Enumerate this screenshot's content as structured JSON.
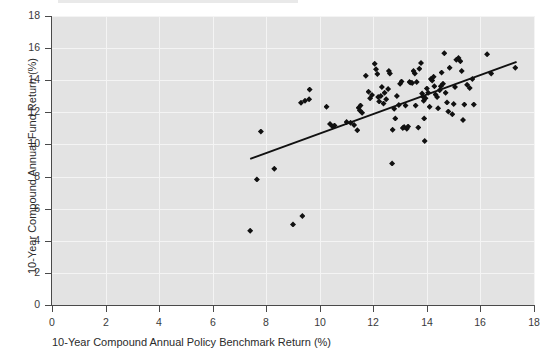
{
  "chart_data": {
    "type": "scatter",
    "title": "",
    "xlabel": "10-Year Compound Annual Policy Benchmark Return (%)",
    "ylabel": "10-Year Compound Annual Fund Return (%)",
    "xlim": [
      0,
      18
    ],
    "ylim": [
      0,
      18
    ],
    "xticks": [
      0,
      2,
      4,
      6,
      8,
      10,
      12,
      14,
      16,
      18
    ],
    "yticks": [
      0,
      2,
      4,
      6,
      8,
      10,
      12,
      14,
      16,
      18
    ],
    "xtick_labels": [
      "0",
      "2",
      "4",
      "6",
      "8",
      "10",
      "12",
      "14",
      "16",
      "18"
    ],
    "ytick_labels": [
      "0",
      "2",
      "4",
      "6",
      "8",
      "10",
      "12",
      "14",
      "16",
      "18"
    ],
    "grid": true,
    "grid_color": "#f4f4f4",
    "plot_background": "#e3e3e3",
    "marker": "diamond",
    "marker_color": "#111111",
    "legend": null,
    "series": [
      {
        "name": "Funds",
        "marker_color": "#111111",
        "points": [
          [
            7.4,
            4.62
          ],
          [
            7.65,
            7.82
          ],
          [
            7.8,
            10.8
          ],
          [
            8.3,
            8.48
          ],
          [
            9.0,
            5.02
          ],
          [
            9.35,
            5.55
          ],
          [
            9.3,
            12.6
          ],
          [
            9.45,
            12.72
          ],
          [
            9.6,
            12.82
          ],
          [
            9.62,
            13.42
          ],
          [
            10.25,
            12.35
          ],
          [
            10.38,
            11.28
          ],
          [
            10.48,
            11.12
          ],
          [
            10.55,
            11.18
          ],
          [
            11.0,
            11.4
          ],
          [
            11.15,
            11.35
          ],
          [
            11.28,
            11.22
          ],
          [
            11.4,
            10.88
          ],
          [
            11.45,
            12.28
          ],
          [
            11.5,
            12.12
          ],
          [
            11.52,
            12.42
          ],
          [
            11.58,
            11.98
          ],
          [
            11.72,
            14.28
          ],
          [
            11.82,
            13.28
          ],
          [
            11.88,
            12.88
          ],
          [
            11.95,
            13.08
          ],
          [
            12.05,
            15.02
          ],
          [
            12.1,
            14.68
          ],
          [
            12.15,
            14.38
          ],
          [
            12.18,
            12.95
          ],
          [
            12.22,
            12.68
          ],
          [
            12.28,
            13.02
          ],
          [
            12.32,
            13.58
          ],
          [
            12.38,
            12.55
          ],
          [
            12.42,
            13.22
          ],
          [
            12.48,
            12.82
          ],
          [
            12.55,
            13.45
          ],
          [
            12.58,
            14.58
          ],
          [
            12.62,
            14.42
          ],
          [
            12.7,
            8.82
          ],
          [
            12.72,
            10.92
          ],
          [
            12.78,
            12.22
          ],
          [
            12.82,
            11.62
          ],
          [
            12.88,
            13.02
          ],
          [
            12.95,
            12.45
          ],
          [
            13.0,
            13.78
          ],
          [
            13.05,
            13.92
          ],
          [
            13.1,
            11.02
          ],
          [
            13.15,
            11.08
          ],
          [
            13.2,
            12.42
          ],
          [
            13.25,
            10.98
          ],
          [
            13.3,
            11.12
          ],
          [
            13.35,
            13.88
          ],
          [
            13.4,
            13.85
          ],
          [
            13.45,
            13.82
          ],
          [
            13.5,
            14.58
          ],
          [
            13.55,
            14.42
          ],
          [
            13.58,
            12.42
          ],
          [
            13.62,
            13.88
          ],
          [
            13.68,
            11.05
          ],
          [
            13.72,
            14.72
          ],
          [
            13.78,
            15.08
          ],
          [
            13.82,
            13.18
          ],
          [
            13.85,
            12.98
          ],
          [
            13.88,
            12.72
          ],
          [
            13.9,
            11.62
          ],
          [
            13.92,
            10.22
          ],
          [
            13.95,
            12.88
          ],
          [
            14.0,
            13.48
          ],
          [
            14.05,
            13.22
          ],
          [
            14.1,
            12.35
          ],
          [
            14.15,
            14.08
          ],
          [
            14.2,
            13.98
          ],
          [
            14.25,
            14.22
          ],
          [
            14.28,
            13.62
          ],
          [
            14.32,
            13.12
          ],
          [
            14.38,
            12.95
          ],
          [
            14.42,
            12.25
          ],
          [
            14.48,
            13.38
          ],
          [
            14.52,
            13.62
          ],
          [
            14.55,
            14.48
          ],
          [
            14.6,
            13.78
          ],
          [
            14.65,
            15.68
          ],
          [
            14.7,
            13.22
          ],
          [
            14.75,
            12.62
          ],
          [
            14.8,
            12.05
          ],
          [
            14.85,
            14.78
          ],
          [
            14.95,
            11.88
          ],
          [
            15.0,
            12.52
          ],
          [
            15.05,
            13.58
          ],
          [
            15.1,
            15.28
          ],
          [
            15.18,
            15.38
          ],
          [
            15.25,
            15.18
          ],
          [
            15.3,
            14.58
          ],
          [
            15.35,
            11.52
          ],
          [
            15.4,
            12.48
          ],
          [
            15.5,
            13.72
          ],
          [
            15.6,
            13.52
          ],
          [
            15.7,
            14.08
          ],
          [
            15.75,
            12.48
          ],
          [
            16.25,
            15.62
          ],
          [
            16.4,
            14.42
          ],
          [
            17.3,
            14.78
          ]
        ]
      }
    ],
    "trendline": {
      "type": "linear",
      "color": "#111111",
      "x_start": 7.4,
      "y_start": 9.1,
      "x_end": 17.35,
      "y_end": 15.15
    }
  }
}
